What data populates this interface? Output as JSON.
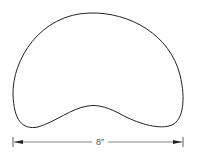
{
  "diagram": {
    "shape_name": "kidney-shaped outline",
    "dimension": {
      "label": "8″",
      "direction": "horizontal"
    },
    "colors": {
      "stroke": "#222222",
      "dimension_line": "#333333",
      "background": "#ffffff"
    }
  }
}
